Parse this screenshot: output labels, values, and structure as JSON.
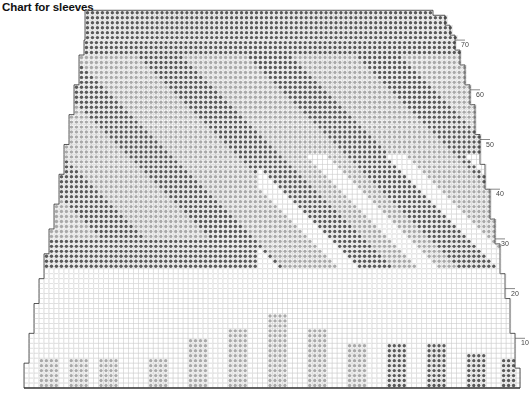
{
  "title": "Chart for sleeves",
  "chart_data": {
    "type": "knitting-chart",
    "title": "Chart for sleeves",
    "rows": 76,
    "row_labels": [
      10,
      20,
      30,
      40,
      50,
      60,
      70
    ],
    "label_side": "right",
    "symbols": {
      "dark": "dark grey dot (main colour)",
      "light": "light grey dot (contrast colour)",
      "blank": "white square (background colour)"
    },
    "shaping": "sleeve widens from narrow cuff at bottom to wide top; stepped edges on both sides",
    "motifs": [
      "bottom: small light-dot pillars of increasing height toward centre",
      "bottom right: dark-dot rectangular blocks",
      "upper: diagonal bands of dark and light dots with white diagonal stripes on right"
    ]
  },
  "colors": {
    "dark": "#5a5a5a",
    "light": "#a9a9a9",
    "grid": "#cfcfcf",
    "outline": "#333333"
  }
}
